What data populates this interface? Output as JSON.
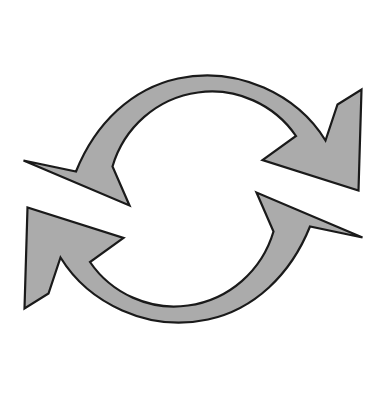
{
  "image": {
    "title": "Circular cycle arrows",
    "description": "Two thick curved arrows arranged in a circle forming a refresh / cycle / recycling symbol",
    "width": 387,
    "height": 397,
    "background_color": "#ffffff"
  },
  "style": {
    "fill_color": "#ababab",
    "stroke_color": "#1a1a1a",
    "stroke_width": 2.2
  },
  "geometry": {
    "center_x": 193,
    "center_y": 199,
    "inner_radius": 116,
    "outer_radius": 170,
    "band_thickness": 54
  },
  "shapes": [
    {
      "name": "top-arrow",
      "label": "Upper clockwise arrow",
      "direction": "clockwise",
      "tip_x": 359,
      "tip_y": 190,
      "tail_x": 22,
      "tail_y": 160,
      "path": "M 23.5 160.5 L 76.0 171.5 C 95.5 123.0 132.0 88.5 178.0 78.5 C 238.0 65.5 297.5 95.0 325.5 140.5 L 337.5 104.5 L 361.5 89.5 L 358.5 190.5 L 262.5 160.0 L 296.0 136.0 C 274.5 104.5 236.0 87.0 198.0 92.5 C 157.0 98.0 124.0 127.5 112.5 166.5 L 129.5 205.5 Z"
    },
    {
      "name": "bottom-arrow",
      "label": "Lower counter-clockwise arrow",
      "direction": "counter-clockwise",
      "tip_x": 28,
      "tip_y": 206,
      "tail_x": 362,
      "tail_y": 250,
      "path": "M 362.5 237.5 L 310.0 226.5 C 290.5 275.0 254.0 309.5 208.0 319.5 C 148.0 332.5 88.5 303.0 60.5 257.5 L 48.5 293.5 L 24.5 308.5 L 27.5 207.5 L 123.5 238.0 L 90.0 262.0 C 111.5 293.5 150.0 311.0 188.0 305.5 C 229.0 300.0 262.0 270.5 273.5 231.5 L 256.5 192.5 Z"
    }
  ]
}
